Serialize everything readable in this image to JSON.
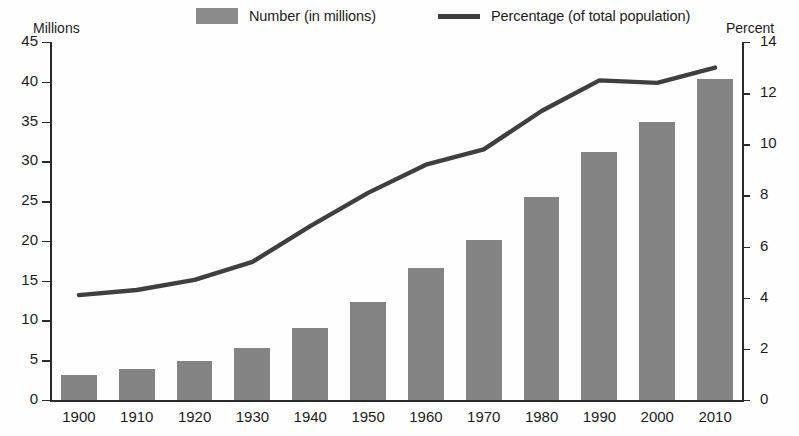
{
  "legend": {
    "entries": [
      {
        "id": "number",
        "label": "Number (in millions)",
        "marker": "square-swatch",
        "color": "#8b8b8b"
      },
      {
        "id": "percentage",
        "label": "Percentage (of total population)",
        "marker": "line-swatch",
        "color": "#3f3f3f"
      }
    ]
  },
  "axes": {
    "left_caption": "Millions",
    "right_caption": "Percent",
    "left_ticks": [
      "45",
      "40",
      "35",
      "30",
      "25",
      "20",
      "15",
      "10",
      "5",
      "0"
    ],
    "right_ticks": [
      "14",
      "12",
      "10",
      "8",
      "6",
      "4",
      "2",
      "0"
    ]
  },
  "chart_data": {
    "type": "bar",
    "title": "",
    "subtitle": "",
    "xlabel": "",
    "ylabel": "Millions",
    "y2label": "Percent",
    "ylim": [
      0,
      45
    ],
    "y2lim": [
      0,
      14
    ],
    "grid": false,
    "legend_position": "top",
    "categories": [
      "1900",
      "1910",
      "1920",
      "1930",
      "1940",
      "1950",
      "1960",
      "1970",
      "1980",
      "1990",
      "2000",
      "2010"
    ],
    "series": [
      {
        "name": "Number (in millions)",
        "type": "bar",
        "axis": "left",
        "color": "#838383",
        "values": [
          3.1,
          3.9,
          4.9,
          6.6,
          9.0,
          12.3,
          16.6,
          20.1,
          25.5,
          31.2,
          35.0,
          40.3
        ]
      },
      {
        "name": "Percentage (of total population)",
        "type": "line",
        "axis": "right",
        "color": "#3f3f3f",
        "values": [
          4.1,
          4.3,
          4.7,
          5.4,
          6.8,
          8.1,
          9.2,
          9.8,
          11.3,
          12.5,
          12.4,
          13.0
        ]
      }
    ]
  }
}
